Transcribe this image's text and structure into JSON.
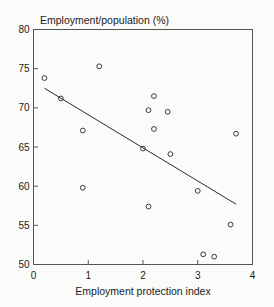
{
  "chart_data": {
    "type": "scatter",
    "title": "",
    "ylabel": "Employment/population (%)",
    "xlabel": "Employment protection index",
    "xlim": [
      0,
      4
    ],
    "ylim": [
      50,
      80
    ],
    "xticks": [
      0,
      1,
      2,
      3,
      4
    ],
    "yticks": [
      50,
      55,
      60,
      65,
      70,
      75,
      80
    ],
    "xtick_labels": [
      "0",
      "1",
      "2",
      "3",
      "4"
    ],
    "ytick_labels": [
      "50",
      "55",
      "60",
      "65",
      "70",
      "75",
      "80"
    ],
    "grid": false,
    "legend": null,
    "marker_style": "open-circle",
    "points": [
      {
        "x": 0.2,
        "y": 73.8
      },
      {
        "x": 0.5,
        "y": 71.2
      },
      {
        "x": 0.9,
        "y": 67.1
      },
      {
        "x": 0.9,
        "y": 59.8
      },
      {
        "x": 1.2,
        "y": 75.3
      },
      {
        "x": 2.0,
        "y": 64.8
      },
      {
        "x": 2.1,
        "y": 69.7
      },
      {
        "x": 2.1,
        "y": 57.4
      },
      {
        "x": 2.2,
        "y": 71.5
      },
      {
        "x": 2.2,
        "y": 67.3
      },
      {
        "x": 2.45,
        "y": 69.5
      },
      {
        "x": 2.5,
        "y": 64.1
      },
      {
        "x": 3.0,
        "y": 59.4
      },
      {
        "x": 3.1,
        "y": 51.3
      },
      {
        "x": 3.3,
        "y": 51.0
      },
      {
        "x": 3.6,
        "y": 55.1
      },
      {
        "x": 3.7,
        "y": 66.7
      }
    ],
    "trendline": {
      "x0": 0.2,
      "y0": 72.5,
      "x1": 3.7,
      "y1": 57.7,
      "slope": -4.23,
      "intercept": 73.35
    }
  },
  "axes": {
    "ylabel_text": "Employment/population (%)",
    "xlabel_text": "Employment protection index"
  }
}
